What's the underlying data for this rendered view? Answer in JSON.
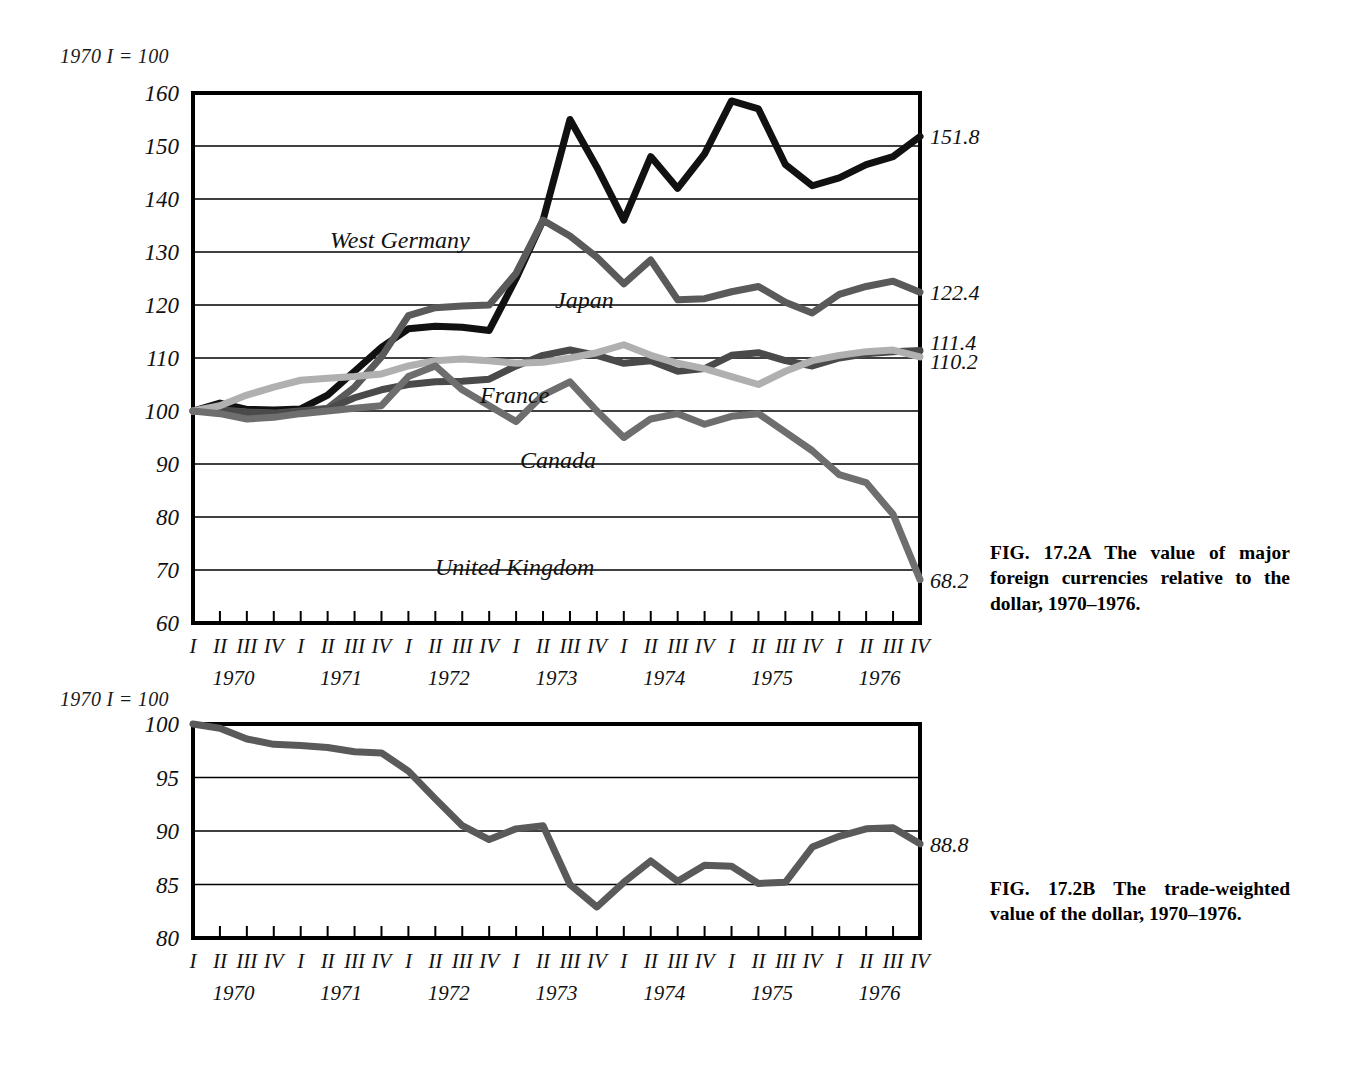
{
  "figureA": {
    "index_note": "1970 I = 100",
    "caption": "FIG. 17.2A The value of major foreign currencies relative to the dollar, 1970–1976.",
    "series_labels": {
      "west_germany": "West Germany",
      "japan": "Japan",
      "france": "France",
      "canada": "Canada",
      "united_kingdom": "United Kingdom"
    },
    "end_labels": {
      "west_germany": "151.8",
      "japan": "122.4",
      "france": "111.4",
      "canada": "110.2",
      "united_kingdom": "68.2"
    }
  },
  "figureB": {
    "index_note": "1970 I = 100",
    "caption": "FIG. 17.2B The trade-weighted value of the dollar, 1970–1976.",
    "end_labels": {
      "dollar": "88.8"
    }
  },
  "quarter_ticks": [
    "I",
    "II",
    "III",
    "IV",
    "I",
    "II",
    "III",
    "IV",
    "I",
    "II",
    "III",
    "IV",
    "I",
    "II",
    "III",
    "IV",
    "I",
    "II",
    "III",
    "IV",
    "I",
    "II",
    "III",
    "IV",
    "I",
    "II",
    "III",
    "IV"
  ],
  "years": [
    "1970",
    "1971",
    "1972",
    "1973",
    "1974",
    "1975",
    "1976"
  ],
  "colors": {
    "west_germany": "#111111",
    "japan": "#5a5a5a",
    "france": "#4a4a4a",
    "canada": "#b0b0b0",
    "united_kingdom": "#6e6e6e",
    "dollar": "#5a5a5a",
    "axis": "#000000",
    "grid": "#000000"
  },
  "chart_data": [
    {
      "type": "line",
      "id": "fig-17-2A",
      "title": "The value of major foreign currencies relative to the dollar, 1970–1976",
      "xlabel": "",
      "ylabel": "1970 I = 100",
      "ylim": [
        60,
        160
      ],
      "ytick_labels": [
        "160",
        "150",
        "140",
        "130",
        "120",
        "110",
        "100",
        "90",
        "80",
        "70",
        "60"
      ],
      "yticks": [
        160,
        150,
        140,
        130,
        120,
        110,
        100,
        90,
        80,
        70,
        60
      ],
      "grid": true,
      "legend": "inline-annotations",
      "x": [
        "1970 I",
        "1970 II",
        "1970 III",
        "1970 IV",
        "1971 I",
        "1971 II",
        "1971 III",
        "1971 IV",
        "1972 I",
        "1972 II",
        "1972 III",
        "1972 IV",
        "1973 I",
        "1973 II",
        "1973 III",
        "1973 IV",
        "1974 I",
        "1974 II",
        "1974 III",
        "1974 IV",
        "1975 I",
        "1975 II",
        "1975 III",
        "1975 IV",
        "1976 I",
        "1976 II",
        "1976 III",
        "1976 IV"
      ],
      "series": [
        {
          "name": "West Germany",
          "color": "#111111",
          "values": [
            100.0,
            101.5,
            100.3,
            100.2,
            100.4,
            103.0,
            107.5,
            112.0,
            115.5,
            116.0,
            115.8,
            115.2,
            125.0,
            136.0,
            155.0,
            146.0,
            136.0,
            148.0,
            142.0,
            148.5,
            158.5,
            157.0,
            146.5,
            142.5,
            144.0,
            146.5,
            148.0,
            151.8
          ]
        },
        {
          "name": "Japan",
          "color": "#5a5a5a",
          "values": [
            100.0,
            100.2,
            99.8,
            99.6,
            100.0,
            100.5,
            104.5,
            110.2,
            118.0,
            119.5,
            119.8,
            120.0,
            126.0,
            136.0,
            133.0,
            129.0,
            124.0,
            128.5,
            121.0,
            121.2,
            122.5,
            123.5,
            120.5,
            118.5,
            122.0,
            123.5,
            124.5,
            122.4
          ]
        },
        {
          "name": "France",
          "color": "#4a4a4a",
          "values": [
            100.0,
            100.1,
            99.7,
            99.5,
            99.9,
            100.3,
            102.5,
            104.0,
            105.0,
            105.5,
            105.6,
            106.0,
            108.5,
            110.5,
            111.5,
            110.5,
            109.0,
            109.5,
            107.5,
            108.0,
            110.5,
            111.0,
            109.5,
            108.5,
            110.0,
            110.8,
            111.2,
            111.4
          ]
        },
        {
          "name": "Canada",
          "color": "#b0b0b0",
          "values": [
            100.0,
            101.0,
            103.0,
            104.5,
            105.8,
            106.2,
            106.5,
            107.0,
            108.5,
            109.5,
            109.8,
            109.5,
            109.0,
            109.2,
            110.0,
            111.0,
            112.5,
            110.5,
            109.0,
            108.0,
            106.5,
            105.0,
            107.5,
            109.5,
            110.5,
            111.2,
            111.5,
            110.2
          ]
        },
        {
          "name": "United Kingdom",
          "color": "#6e6e6e",
          "values": [
            100.0,
            99.5,
            98.5,
            98.8,
            99.5,
            100.0,
            100.5,
            101.0,
            106.5,
            108.5,
            104.0,
            101.0,
            98.0,
            103.0,
            105.5,
            100.0,
            95.0,
            98.5,
            99.5,
            97.5,
            99.0,
            99.5,
            96.0,
            92.5,
            88.0,
            86.5,
            80.5,
            68.2
          ]
        }
      ]
    },
    {
      "type": "line",
      "id": "fig-17-2B",
      "title": "The trade-weighted value of the dollar, 1970–1976",
      "xlabel": "",
      "ylabel": "1970 I = 100",
      "ylim": [
        80,
        100
      ],
      "ytick_labels": [
        "100",
        "95",
        "90",
        "85",
        "80"
      ],
      "yticks": [
        100,
        95,
        90,
        85,
        80
      ],
      "grid": true,
      "x": [
        "1970 I",
        "1970 II",
        "1970 III",
        "1970 IV",
        "1971 I",
        "1971 II",
        "1971 III",
        "1971 IV",
        "1972 I",
        "1972 II",
        "1972 III",
        "1972 IV",
        "1973 I",
        "1973 II",
        "1973 III",
        "1973 IV",
        "1974 I",
        "1974 II",
        "1974 III",
        "1974 IV",
        "1975 I",
        "1975 II",
        "1975 III",
        "1975 IV",
        "1976 I",
        "1976 II",
        "1976 III",
        "1976 IV"
      ],
      "series": [
        {
          "name": "Trade-weighted dollar",
          "color": "#5a5a5a",
          "values": [
            100.0,
            99.6,
            98.6,
            98.1,
            98.0,
            97.8,
            97.4,
            97.3,
            95.6,
            93.0,
            90.5,
            89.2,
            90.2,
            90.5,
            85.0,
            82.9,
            85.2,
            87.2,
            85.3,
            86.8,
            86.7,
            85.1,
            85.2,
            88.5,
            89.5,
            90.2,
            90.3,
            88.8
          ]
        }
      ]
    }
  ]
}
